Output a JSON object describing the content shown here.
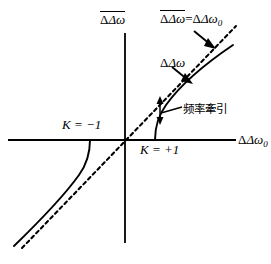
{
  "figure": {
    "type": "line-diagram",
    "background_color": "#ffffff",
    "stroke_color": "#000000",
    "axes": {
      "origin": {
        "x": 125,
        "y": 140
      },
      "x_axis": {
        "label": "Δω",
        "label_subscript": "0",
        "name": "delta-omega-zero",
        "start_x": 8,
        "end_x": 236,
        "y": 140,
        "arrow": false
      },
      "y_axis": {
        "label": "Δω",
        "label_overbar": true,
        "name": "delta-omega-bar",
        "x": 125,
        "start_y": 33,
        "end_y": 243,
        "arrow": false
      }
    },
    "labels": {
      "y_axis_label": "Δω",
      "x_axis_label": "Δω",
      "x_axis_subscript": "0",
      "diagonal_label_left": "Δω",
      "diagonal_label_equals": "=",
      "diagonal_label_right": "Δω",
      "diagonal_label_subscript": "0",
      "delta_omega_label": "Δω",
      "frequency_pulling_label": "频率牽引",
      "k_minus_one_label": "K = −1",
      "k_plus_one_label": "K = +1",
      "caption": ""
    },
    "curves": [
      {
        "name": "asymptote-dashed-line",
        "style": "dashed",
        "description": "45 degree reference line where delta-omega-bar equals delta-omega-zero",
        "from": {
          "x": 22,
          "y": 248
        },
        "to": {
          "x": 236,
          "y": 26
        }
      },
      {
        "name": "k-equals-plus-one-branch",
        "style": "solid",
        "description": "upper right branch rising from x axis and approaching the dashed asymptote",
        "x_intercept": 155,
        "to": {
          "x": 233,
          "y": 45
        }
      },
      {
        "name": "k-equals-minus-one-branch",
        "style": "solid",
        "description": "lower left branch falling from x axis and approaching the dashed asymptote",
        "x_intercept": 90,
        "to": {
          "x": 14,
          "y": 246
        }
      }
    ],
    "annotations": [
      {
        "name": "diagonal-pointer-arrow",
        "type": "arrow",
        "points_to": "asymptote-dashed-line",
        "from": {
          "x": 194,
          "y": 32
        },
        "to": {
          "x": 214,
          "y": 47
        }
      },
      {
        "name": "delta-omega-pointer-arrow",
        "type": "arrow",
        "points_to": "k-equals-plus-one-branch",
        "from": {
          "x": 172,
          "y": 68
        },
        "to": {
          "x": 191,
          "y": 83
        }
      },
      {
        "name": "frequency-pulling-double-arrow",
        "type": "double-headed-arrow",
        "orientation": "vertical",
        "description": "gap between dashed asymptote and solid branch",
        "x": 160,
        "top_y": 98,
        "bottom_y": 123
      },
      {
        "name": "frequency-pulling-leader-line",
        "type": "leader",
        "from": {
          "x": 160,
          "y": 112
        },
        "to": {
          "x": 181,
          "y": 107
        }
      }
    ]
  }
}
